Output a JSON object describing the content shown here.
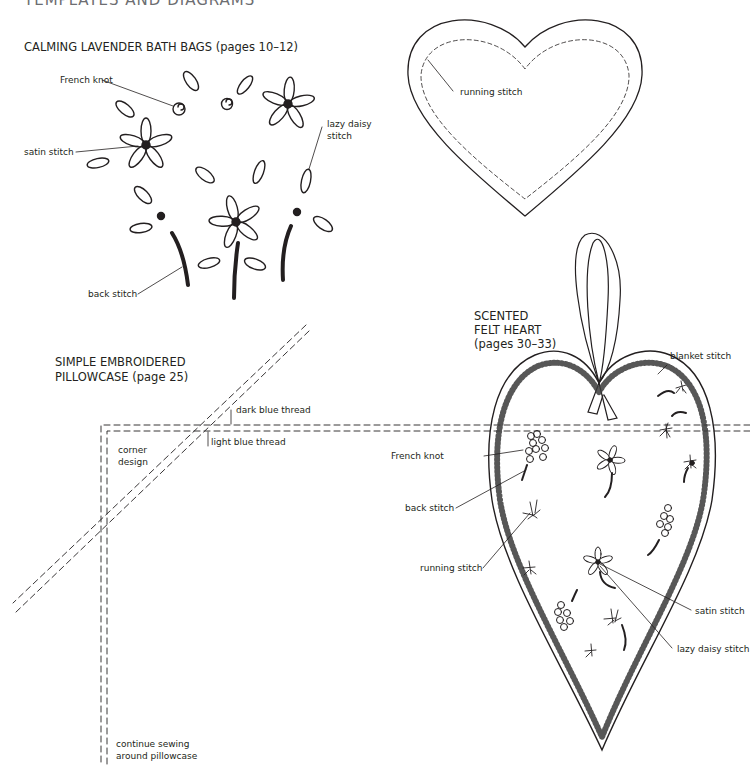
{
  "page": {
    "header": "TEMPLATES AND DIAGRAMS"
  },
  "bath_bags": {
    "title": "CALMING LAVENDER BATH BAGS (pages 10–12)",
    "labels": {
      "french_knot": "French knot",
      "satin_stitch": "satin stitch",
      "lazy_daisy_line1": "lazy daisy",
      "lazy_daisy_line2": "stitch",
      "back_stitch": "back stitch"
    }
  },
  "heart_template": {
    "labels": {
      "running_stitch": "running stitch"
    }
  },
  "pillowcase": {
    "title_line1": "SIMPLE EMBROIDERED",
    "title_line2": "PILLOWCASE (page 25)",
    "labels": {
      "dark_blue_thread": "dark blue thread",
      "light_blue_thread": "light blue thread",
      "corner_line1": "corner",
      "corner_line2": "design",
      "continue_line1": "continue sewing",
      "continue_line2": "around pillowcase"
    }
  },
  "felt_heart": {
    "title_line1": "SCENTED",
    "title_line2": "FELT HEART",
    "title_line3": "(pages 30–33)",
    "labels": {
      "blanket_stitch": "blanket stitch",
      "french_knot": "French knot",
      "back_stitch": "back stitch",
      "running_stitch": "running stitch",
      "satin_stitch": "satin stitch",
      "lazy_daisy_stitch": "lazy daisy stitch"
    }
  },
  "colors": {
    "ink": "#231f20",
    "header_gray": "#6d6e71",
    "background": "#ffffff"
  }
}
